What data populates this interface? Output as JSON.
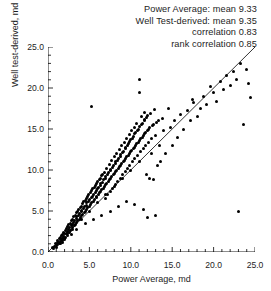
{
  "annotation": {
    "lines": [
      "Power Average: mean 9.33",
      "Well Test-derived: mean 9.35",
      "correlation 0.83",
      "rank correlation 0.85"
    ]
  },
  "axes": {
    "x_title": "Power Average, md",
    "y_title": "Well test-derived, md",
    "x_ticklabels": [
      "0.0",
      "5.0",
      "10.0",
      "15.0",
      "20.0",
      "25.0"
    ],
    "y_ticklabels": [
      "0.0",
      "5.0",
      "10.0",
      "15.0",
      "20.0",
      "25.0"
    ]
  },
  "chart_data": {
    "type": "scatter",
    "title": "",
    "xlabel": "Power Average, md",
    "ylabel": "Well test-derived, md",
    "xlim": [
      0,
      25
    ],
    "ylim": [
      0,
      25
    ],
    "xticks": [
      0,
      5,
      10,
      15,
      20,
      25
    ],
    "yticks": [
      0,
      5,
      10,
      15,
      20,
      25
    ],
    "minor_tick_interval": 1,
    "grid": false,
    "legend": null,
    "reference_line": {
      "type": "identity",
      "slope": 1,
      "intercept": 0,
      "from": [
        0,
        0
      ],
      "to": [
        25,
        25
      ]
    },
    "statistics": {
      "x_mean": 9.33,
      "y_mean": 9.35,
      "correlation": 0.83,
      "rank_correlation": 0.85
    },
    "points": [
      [
        0.6,
        0.5
      ],
      [
        0.8,
        0.7
      ],
      [
        0.9,
        1.0
      ],
      [
        1.0,
        0.8
      ],
      [
        1.1,
        1.2
      ],
      [
        1.2,
        0.9
      ],
      [
        1.2,
        1.4
      ],
      [
        1.3,
        1.1
      ],
      [
        1.4,
        1.6
      ],
      [
        1.4,
        1.0
      ],
      [
        1.5,
        1.3
      ],
      [
        1.5,
        1.8
      ],
      [
        1.6,
        1.5
      ],
      [
        1.6,
        2.0
      ],
      [
        1.7,
        1.2
      ],
      [
        1.7,
        1.7
      ],
      [
        1.8,
        2.1
      ],
      [
        1.8,
        1.4
      ],
      [
        1.9,
        1.9
      ],
      [
        1.9,
        2.4
      ],
      [
        2.0,
        1.6
      ],
      [
        2.0,
        2.2
      ],
      [
        2.1,
        2.6
      ],
      [
        2.1,
        1.8
      ],
      [
        2.2,
        2.3
      ],
      [
        2.2,
        2.9
      ],
      [
        2.3,
        2.0
      ],
      [
        2.3,
        2.5
      ],
      [
        2.4,
        3.1
      ],
      [
        2.4,
        2.2
      ],
      [
        2.5,
        2.7
      ],
      [
        2.5,
        3.3
      ],
      [
        2.6,
        2.4
      ],
      [
        2.6,
        3.0
      ],
      [
        2.7,
        3.5
      ],
      [
        2.7,
        2.6
      ],
      [
        2.8,
        3.2
      ],
      [
        2.8,
        3.8
      ],
      [
        2.9,
        2.8
      ],
      [
        2.9,
        3.4
      ],
      [
        3.0,
        4.0
      ],
      [
        3.0,
        3.0
      ],
      [
        3.1,
        3.6
      ],
      [
        3.1,
        4.3
      ],
      [
        3.2,
        3.2
      ],
      [
        3.2,
        3.9
      ],
      [
        3.3,
        4.5
      ],
      [
        3.3,
        3.4
      ],
      [
        3.4,
        4.1
      ],
      [
        3.4,
        4.8
      ],
      [
        3.5,
        3.6
      ],
      [
        3.5,
        4.3
      ],
      [
        3.6,
        5.0
      ],
      [
        3.6,
        3.8
      ],
      [
        3.7,
        4.5
      ],
      [
        3.7,
        5.2
      ],
      [
        3.8,
        4.0
      ],
      [
        3.8,
        4.7
      ],
      [
        3.9,
        5.4
      ],
      [
        3.9,
        4.2
      ],
      [
        4.0,
        4.9
      ],
      [
        4.0,
        5.6
      ],
      [
        4.1,
        4.4
      ],
      [
        4.1,
        5.1
      ],
      [
        4.2,
        5.9
      ],
      [
        4.2,
        4.6
      ],
      [
        4.3,
        5.3
      ],
      [
        4.3,
        6.1
      ],
      [
        4.4,
        4.8
      ],
      [
        4.4,
        5.5
      ],
      [
        4.5,
        6.3
      ],
      [
        4.5,
        5.0
      ],
      [
        4.6,
        5.7
      ],
      [
        4.6,
        6.5
      ],
      [
        4.7,
        5.2
      ],
      [
        4.7,
        6.0
      ],
      [
        4.8,
        6.8
      ],
      [
        4.8,
        5.4
      ],
      [
        4.9,
        6.2
      ],
      [
        4.9,
        7.0
      ],
      [
        5.0,
        5.6
      ],
      [
        5.0,
        6.4
      ],
      [
        5.1,
        7.2
      ],
      [
        5.1,
        5.8
      ],
      [
        5.2,
        6.6
      ],
      [
        5.2,
        7.5
      ],
      [
        5.3,
        6.0
      ],
      [
        5.3,
        17.8
      ],
      [
        5.4,
        6.8
      ],
      [
        5.4,
        7.7
      ],
      [
        5.5,
        6.2
      ],
      [
        5.5,
        7.0
      ],
      [
        5.6,
        7.9
      ],
      [
        5.6,
        6.4
      ],
      [
        5.7,
        7.3
      ],
      [
        5.7,
        8.1
      ],
      [
        5.8,
        6.6
      ],
      [
        5.8,
        7.5
      ],
      [
        5.9,
        8.4
      ],
      [
        5.9,
        6.8
      ],
      [
        6.0,
        7.7
      ],
      [
        6.0,
        8.6
      ],
      [
        6.1,
        7.0
      ],
      [
        6.1,
        7.9
      ],
      [
        6.2,
        8.8
      ],
      [
        6.2,
        7.2
      ],
      [
        6.3,
        8.1
      ],
      [
        6.3,
        9.0
      ],
      [
        6.4,
        7.4
      ],
      [
        6.4,
        8.3
      ],
      [
        6.5,
        9.3
      ],
      [
        6.5,
        7.6
      ],
      [
        6.6,
        8.5
      ],
      [
        6.6,
        9.5
      ],
      [
        6.7,
        7.8
      ],
      [
        6.7,
        8.8
      ],
      [
        6.8,
        9.7
      ],
      [
        6.8,
        8.0
      ],
      [
        6.9,
        9.0
      ],
      [
        6.9,
        6.5
      ],
      [
        7.0,
        8.2
      ],
      [
        7.0,
        9.2
      ],
      [
        7.1,
        10.2
      ],
      [
        7.1,
        8.4
      ],
      [
        7.2,
        9.4
      ],
      [
        7.2,
        7.0
      ],
      [
        7.3,
        8.6
      ],
      [
        7.3,
        9.7
      ],
      [
        7.4,
        10.7
      ],
      [
        7.4,
        8.8
      ],
      [
        7.5,
        9.9
      ],
      [
        7.5,
        7.4
      ],
      [
        7.6,
        9.0
      ],
      [
        7.6,
        10.1
      ],
      [
        7.7,
        11.1
      ],
      [
        7.7,
        9.2
      ],
      [
        7.8,
        10.3
      ],
      [
        7.8,
        7.8
      ],
      [
        7.9,
        9.4
      ],
      [
        7.9,
        10.5
      ],
      [
        8.0,
        11.6
      ],
      [
        8.0,
        9.6
      ],
      [
        8.1,
        10.8
      ],
      [
        8.1,
        8.2
      ],
      [
        8.2,
        9.8
      ],
      [
        8.2,
        11.0
      ],
      [
        8.3,
        12.0
      ],
      [
        8.3,
        10.0
      ],
      [
        8.4,
        11.2
      ],
      [
        8.4,
        8.6
      ],
      [
        8.5,
        10.2
      ],
      [
        8.5,
        11.4
      ],
      [
        8.6,
        12.5
      ],
      [
        8.6,
        10.4
      ],
      [
        8.7,
        11.7
      ],
      [
        8.7,
        9.0
      ],
      [
        8.8,
        10.6
      ],
      [
        8.8,
        11.9
      ],
      [
        8.9,
        13.0
      ],
      [
        8.9,
        10.8
      ],
      [
        9.0,
        12.1
      ],
      [
        9.0,
        9.4
      ],
      [
        9.1,
        11.0
      ],
      [
        9.1,
        12.3
      ],
      [
        9.2,
        13.4
      ],
      [
        9.2,
        11.2
      ],
      [
        9.3,
        12.6
      ],
      [
        9.3,
        9.8
      ],
      [
        9.4,
        11.4
      ],
      [
        9.4,
        12.8
      ],
      [
        9.5,
        13.9
      ],
      [
        9.5,
        11.6
      ],
      [
        9.6,
        13.0
      ],
      [
        9.6,
        10.2
      ],
      [
        9.7,
        11.8
      ],
      [
        9.7,
        13.2
      ],
      [
        9.8,
        14.3
      ],
      [
        9.8,
        12.0
      ],
      [
        9.9,
        13.5
      ],
      [
        9.9,
        10.6
      ],
      [
        10.0,
        12.2
      ],
      [
        10.0,
        13.7
      ],
      [
        10.1,
        14.8
      ],
      [
        10.1,
        12.4
      ],
      [
        10.2,
        13.9
      ],
      [
        10.2,
        11.0
      ],
      [
        10.3,
        12.6
      ],
      [
        10.3,
        14.1
      ],
      [
        10.4,
        15.2
      ],
      [
        10.4,
        12.8
      ],
      [
        10.5,
        14.4
      ],
      [
        10.5,
        11.4
      ],
      [
        10.6,
        13.0
      ],
      [
        10.6,
        14.6
      ],
      [
        10.7,
        15.7
      ],
      [
        10.7,
        13.2
      ],
      [
        10.8,
        14.8
      ],
      [
        10.8,
        11.8
      ],
      [
        10.9,
        13.4
      ],
      [
        10.9,
        15.0
      ],
      [
        11.0,
        21.0
      ],
      [
        11.0,
        19.5
      ],
      [
        11.1,
        13.6
      ],
      [
        11.1,
        15.3
      ],
      [
        11.2,
        12.2
      ],
      [
        11.2,
        13.8
      ],
      [
        11.3,
        15.5
      ],
      [
        11.3,
        16.5
      ],
      [
        11.4,
        14.0
      ],
      [
        11.4,
        15.7
      ],
      [
        11.5,
        12.6
      ],
      [
        11.5,
        14.2
      ],
      [
        11.6,
        16.0
      ],
      [
        11.6,
        17.0
      ],
      [
        11.7,
        14.4
      ],
      [
        11.7,
        16.2
      ],
      [
        11.8,
        13.0
      ],
      [
        11.8,
        14.6
      ],
      [
        11.9,
        16.4
      ],
      [
        11.9,
        9.5
      ],
      [
        12.0,
        14.8
      ],
      [
        12.0,
        16.7
      ],
      [
        12.1,
        13.4
      ],
      [
        12.1,
        15.0
      ],
      [
        12.2,
        9.0
      ],
      [
        12.3,
        15.2
      ],
      [
        12.4,
        16.9
      ],
      [
        12.5,
        13.8
      ],
      [
        12.6,
        15.4
      ],
      [
        12.7,
        8.8
      ],
      [
        12.8,
        15.6
      ],
      [
        12.9,
        17.4
      ],
      [
        13.0,
        14.2
      ],
      [
        13.1,
        15.8
      ],
      [
        13.2,
        10.5
      ],
      [
        13.4,
        16.0
      ],
      [
        13.6,
        11.0
      ],
      [
        13.8,
        16.3
      ],
      [
        14.0,
        14.8
      ],
      [
        14.2,
        12.0
      ],
      [
        14.5,
        17.5
      ],
      [
        14.8,
        15.2
      ],
      [
        15.0,
        13.0
      ],
      [
        15.3,
        16.0
      ],
      [
        15.6,
        14.0
      ],
      [
        16.0,
        16.8
      ],
      [
        16.4,
        15.0
      ],
      [
        16.8,
        17.2
      ],
      [
        17.2,
        16.0
      ],
      [
        17.5,
        18.6
      ],
      [
        17.6,
        18.2
      ],
      [
        18.0,
        16.5
      ],
      [
        18.4,
        17.5
      ],
      [
        18.8,
        19.0
      ],
      [
        19.2,
        18.0
      ],
      [
        19.6,
        20.2
      ],
      [
        20.0,
        19.4
      ],
      [
        20.4,
        18.3
      ],
      [
        20.8,
        20.8
      ],
      [
        21.2,
        19.8
      ],
      [
        21.6,
        21.5
      ],
      [
        22.0,
        20.3
      ],
      [
        22.4,
        22.0
      ],
      [
        22.8,
        21.0
      ],
      [
        23.0,
        5.0
      ],
      [
        23.2,
        23.0
      ],
      [
        23.6,
        15.5
      ],
      [
        24.0,
        22.3
      ],
      [
        24.2,
        20.5
      ],
      [
        24.4,
        18.8
      ],
      [
        12.0,
        4.2
      ],
      [
        13.0,
        4.5
      ],
      [
        11.5,
        5.2
      ],
      [
        10.5,
        5.8
      ],
      [
        9.5,
        6.2
      ],
      [
        8.5,
        5.5
      ],
      [
        7.5,
        5.0
      ],
      [
        6.5,
        4.5
      ],
      [
        5.5,
        4.0
      ],
      [
        4.5,
        3.5
      ],
      [
        3.5,
        2.8
      ],
      [
        2.8,
        2.1
      ],
      [
        2.0,
        1.5
      ],
      [
        1.5,
        1.0
      ],
      [
        1.0,
        0.6
      ],
      [
        0.7,
        0.4
      ],
      [
        13.5,
        13.0
      ],
      [
        12.5,
        12.0
      ],
      [
        11.0,
        11.0
      ],
      [
        10.0,
        10.0
      ],
      [
        9.0,
        9.0
      ],
      [
        8.0,
        8.0
      ],
      [
        7.0,
        7.0
      ],
      [
        6.0,
        6.0
      ],
      [
        5.0,
        5.0
      ],
      [
        4.0,
        4.0
      ]
    ]
  }
}
